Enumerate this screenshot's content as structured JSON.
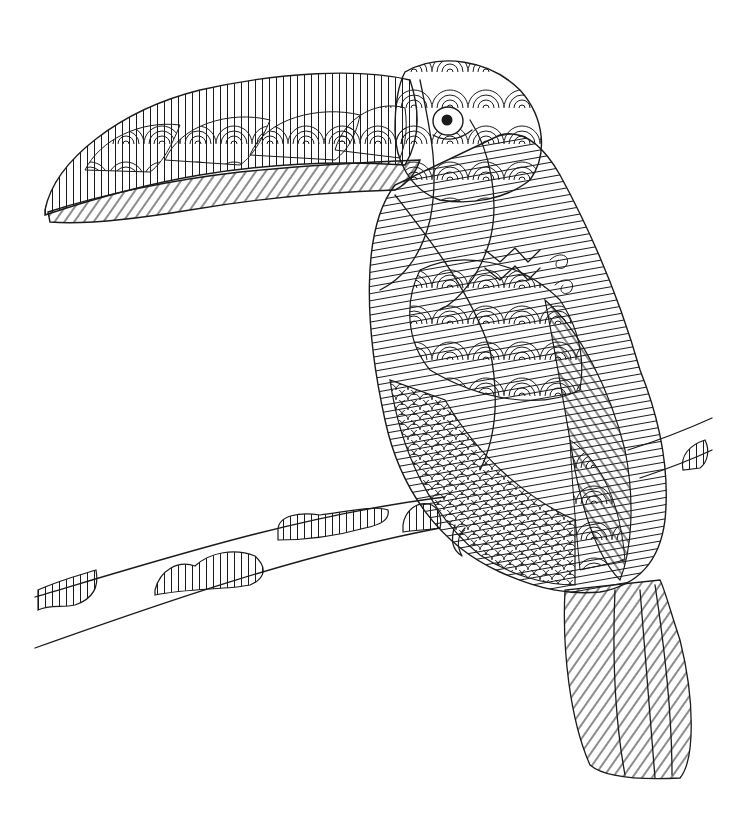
{
  "image": {
    "kind": "coloring-page",
    "subject": "toucan perched on a branch",
    "style": "zentangle line art",
    "colors": {
      "line": "#1a1a1a",
      "background": "#ffffff"
    },
    "alt": "Black-and-white zentangle-style coloring illustration of a toucan perched on a branch"
  }
}
